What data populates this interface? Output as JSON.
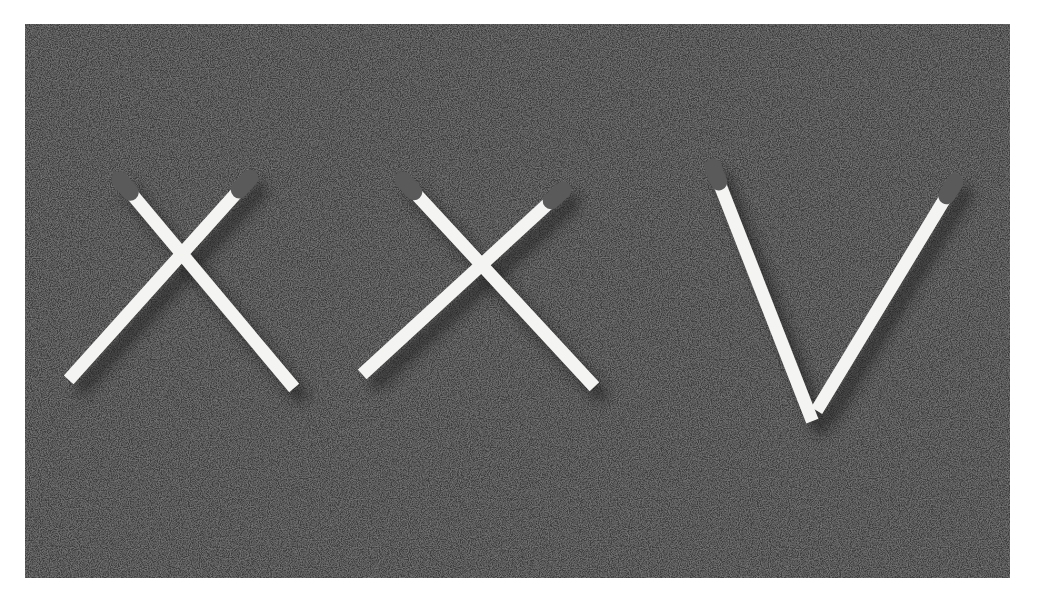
{
  "image": {
    "description": "Six matchsticks arranged on dark gray felt spelling the Roman numeral XXV",
    "numeral": "XXV",
    "letters": [
      "X",
      "X",
      "V"
    ],
    "background_color": "#4a4a4a",
    "border_color": "#ffffff",
    "match_color": "#f4f4f2",
    "match_head_color": "#5a5a5a",
    "match_count": 6
  },
  "matches": [
    {
      "letter_index": 0,
      "head": [
        95,
        156
      ],
      "tail": [
        265,
        359
      ]
    },
    {
      "letter_index": 0,
      "head": [
        225,
        154
      ],
      "tail": [
        48,
        351
      ]
    },
    {
      "letter_index": 1,
      "head": [
        378,
        156
      ],
      "tail": [
        565,
        358
      ]
    },
    {
      "letter_index": 1,
      "head": [
        538,
        166
      ],
      "tail": [
        342,
        346
      ]
    },
    {
      "letter_index": 2,
      "head": [
        688,
        143
      ],
      "tail": [
        785,
        391
      ]
    },
    {
      "letter_index": 2,
      "head": [
        930,
        158
      ],
      "tail": [
        795,
        381
      ]
    }
  ]
}
